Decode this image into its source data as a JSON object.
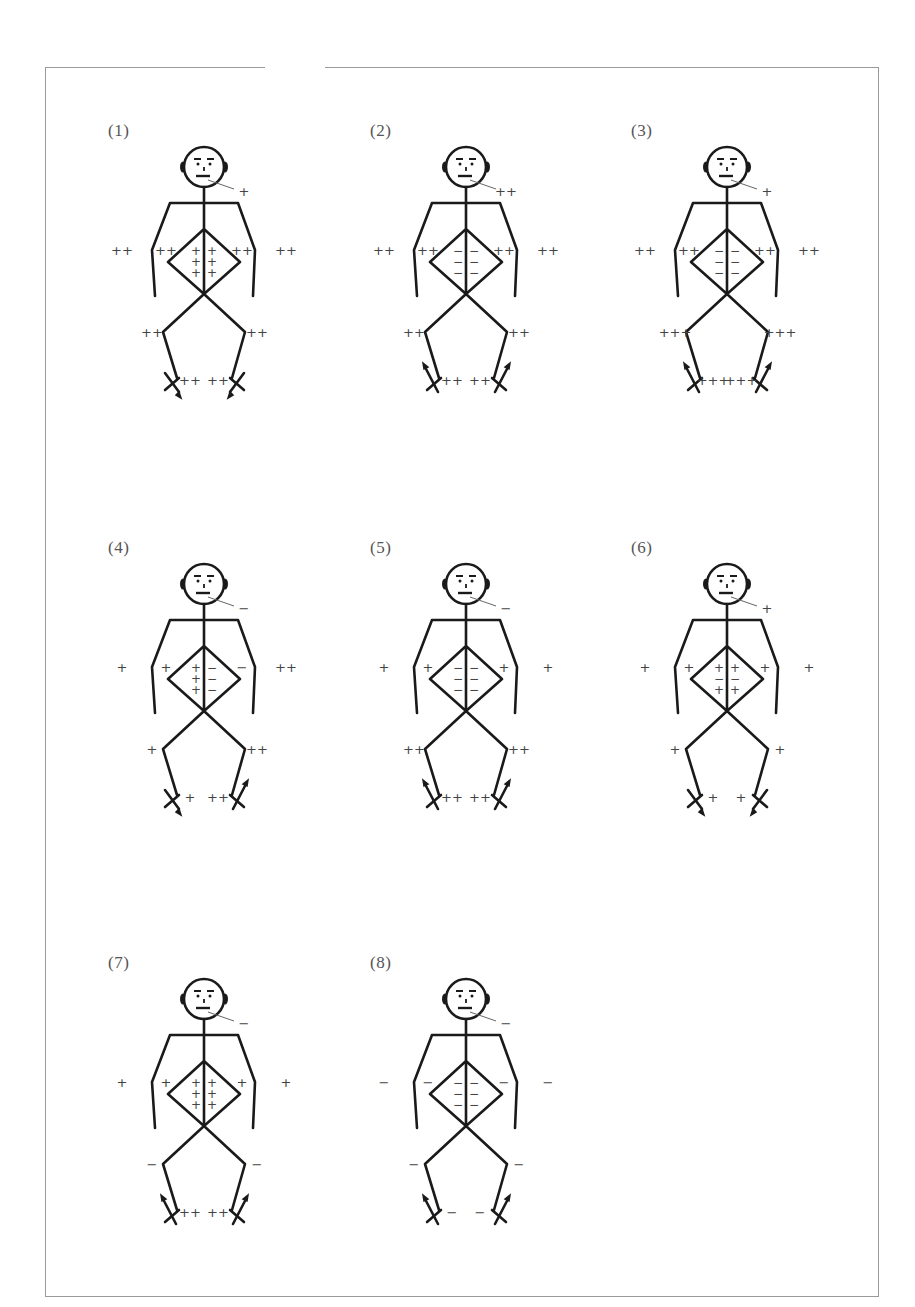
{
  "figures": [
    {
      "label": "(1)",
      "face": "+",
      "left_arm_outer": "++",
      "left_arm_inner": "++",
      "right_arm_inner": "++",
      "right_arm_outer": "++",
      "chest_left": "+\n+\n+",
      "chest_right": "+\n+\n+",
      "left_knee": "++",
      "right_knee": "++",
      "left_foot": "++",
      "right_foot": "++",
      "foot_arrow": "down"
    },
    {
      "label": "(2)",
      "face": "++",
      "left_arm_outer": "++",
      "left_arm_inner": "++",
      "right_arm_inner": "++",
      "right_arm_outer": "++",
      "chest_left": "−\n−\n−",
      "chest_right": "−\n−\n−",
      "left_knee": "++",
      "right_knee": "++",
      "left_foot": "++",
      "right_foot": "++",
      "foot_arrow": "up"
    },
    {
      "label": "(3)",
      "face": "+",
      "left_arm_outer": "++",
      "left_arm_inner": "++",
      "right_arm_inner": "++",
      "right_arm_outer": "++",
      "chest_left": "−\n−\n−",
      "chest_right": "−\n−\n−",
      "left_knee": "+++",
      "right_knee": "+++",
      "left_foot": "+++",
      "right_foot": "+++",
      "foot_arrow": "up"
    },
    {
      "label": "(4)",
      "face": "−",
      "left_arm_outer": "+",
      "left_arm_inner": "+",
      "right_arm_inner": "−",
      "right_arm_outer": "++",
      "chest_left": "+\n+\n+",
      "chest_right": "−\n−\n−",
      "left_knee": "+",
      "right_knee": "++",
      "left_foot": "+",
      "right_foot": "++",
      "foot_arrow": "mixed"
    },
    {
      "label": "(5)",
      "face": "−",
      "left_arm_outer": "+",
      "left_arm_inner": "+",
      "right_arm_inner": "+",
      "right_arm_outer": "+",
      "chest_left": "−\n−\n−",
      "chest_right": "−\n−\n−",
      "left_knee": "++",
      "right_knee": "++",
      "left_foot": "++",
      "right_foot": "++",
      "foot_arrow": "up"
    },
    {
      "label": "(6)",
      "face": "+",
      "left_arm_outer": "+",
      "left_arm_inner": "+",
      "right_arm_inner": "+",
      "right_arm_outer": "+",
      "chest_left": "+\n−\n+",
      "chest_right": "+\n−\n+",
      "left_knee": "+",
      "right_knee": "+",
      "left_foot": "+",
      "right_foot": "+",
      "foot_arrow": "down"
    },
    {
      "label": "(7)",
      "face": "−",
      "left_arm_outer": "+",
      "left_arm_inner": "+",
      "right_arm_inner": "+",
      "right_arm_outer": "+",
      "chest_left": "+\n+\n+",
      "chest_right": "+\n+\n+",
      "left_knee": "−",
      "right_knee": "−",
      "left_foot": "++",
      "right_foot": "++",
      "foot_arrow": "up"
    },
    {
      "label": "(8)",
      "face": "−",
      "left_arm_outer": "−",
      "left_arm_inner": "−",
      "right_arm_inner": "−",
      "right_arm_outer": "−",
      "chest_left": "−\n−\n−",
      "chest_right": "−\n−\n−",
      "left_knee": "−",
      "right_knee": "−",
      "left_foot": "−",
      "right_foot": "−",
      "foot_arrow": "up"
    }
  ]
}
